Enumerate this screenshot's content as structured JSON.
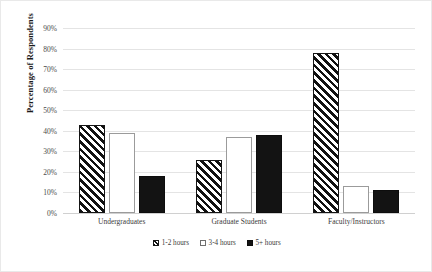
{
  "chart_data": {
    "type": "bar",
    "title": "",
    "xlabel": "",
    "ylabel": "Percentage of Respondents",
    "categories": [
      "Undergraduates",
      "Graduate Students",
      "Faculty/Instructors"
    ],
    "series": [
      {
        "name": "1-2 hours",
        "values": [
          43,
          26,
          78
        ],
        "pattern": "diagonal-hatch"
      },
      {
        "name": "3-4 hours",
        "values": [
          39,
          37,
          13
        ],
        "pattern": "white-outline"
      },
      {
        "name": "5+ hours",
        "values": [
          18,
          38,
          11
        ],
        "pattern": "solid-black"
      }
    ],
    "ylim": [
      0,
      90
    ],
    "ytick_step": 10,
    "ytick_labels": [
      "0%",
      "10%",
      "20%",
      "30%",
      "40%",
      "50%",
      "60%",
      "70%",
      "80%",
      "90%"
    ],
    "ytick_values": [
      0,
      10,
      20,
      30,
      40,
      50,
      60,
      70,
      80,
      90
    ],
    "grid": "horizontal",
    "legend_position": "bottom-center",
    "colors": {
      "gridline": "#e4e4e4",
      "axis_text": "#4a4a4a",
      "bar_black": "#131313",
      "bar_white": "#ffffff",
      "frame": "#e9e9e9"
    }
  }
}
